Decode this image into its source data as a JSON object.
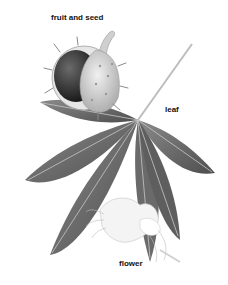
{
  "figure": {
    "labels": {
      "fruit": "fruit and seed",
      "leaf": "leaf",
      "flower": "flower"
    },
    "colors": {
      "background": "#ffffff",
      "leaf_dark": "#5a5a5a",
      "leaf_mid": "#7a7a7a",
      "husk": "#d8d8d8",
      "seed": "#2a2a2a",
      "flower": "#f2f2f2",
      "label": "#111111"
    }
  }
}
